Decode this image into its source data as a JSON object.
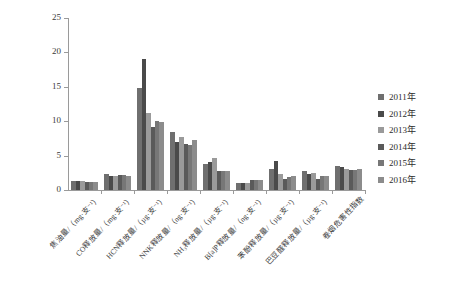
{
  "chart_data": {
    "type": "bar",
    "title": "",
    "subtitle": "",
    "xlabel": "",
    "ylabel": "",
    "ylim": [
      0,
      25
    ],
    "y_ticks": [
      0,
      5,
      10,
      15,
      20,
      25
    ],
    "grid": false,
    "legend_position": "right",
    "categories": [
      "焦油量/（mg·支⁻¹）",
      "CO释放量/（mg·支⁻¹）",
      "HCN释放量/（µg·支⁻¹）",
      "NNK释放量/（ng·支⁻¹）",
      "NH₃释放量/（µg·支⁻¹）",
      "B[a]P释放量/（ng·支⁻¹）",
      "苯酚释放量/（µg·支⁻¹）",
      "巴豆醛释放量/（µg·支⁻¹）",
      "卷烟危害性指数"
    ],
    "series": [
      {
        "name": "2011年",
        "color": "#6f6f6f",
        "values": [
          1.25,
          2.35,
          14.8,
          8.5,
          3.8,
          0.95,
          3.0,
          2.8,
          3.5
        ]
      },
      {
        "name": "2012年",
        "color": "#4a4a4a",
        "values": [
          1.3,
          2.0,
          19.0,
          7.0,
          4.1,
          1.0,
          4.2,
          2.4,
          3.35
        ]
      },
      {
        "name": "2013年",
        "color": "#9a9a9a",
        "values": [
          1.3,
          2.1,
          11.2,
          7.7,
          4.6,
          1.05,
          2.3,
          2.5,
          3.1
        ]
      },
      {
        "name": "2014年",
        "color": "#5a5a5a",
        "values": [
          1.2,
          2.25,
          9.2,
          6.7,
          2.7,
          1.5,
          1.6,
          1.6,
          2.9
        ]
      },
      {
        "name": "2015年",
        "color": "#777777",
        "values": [
          1.15,
          2.15,
          10.0,
          6.6,
          2.7,
          1.45,
          1.95,
          2.1,
          2.9
        ]
      },
      {
        "name": "2016年",
        "color": "#8c8c8c",
        "values": [
          1.15,
          2.1,
          9.9,
          7.2,
          2.8,
          1.4,
          2.0,
          2.0,
          3.0
        ]
      }
    ]
  }
}
